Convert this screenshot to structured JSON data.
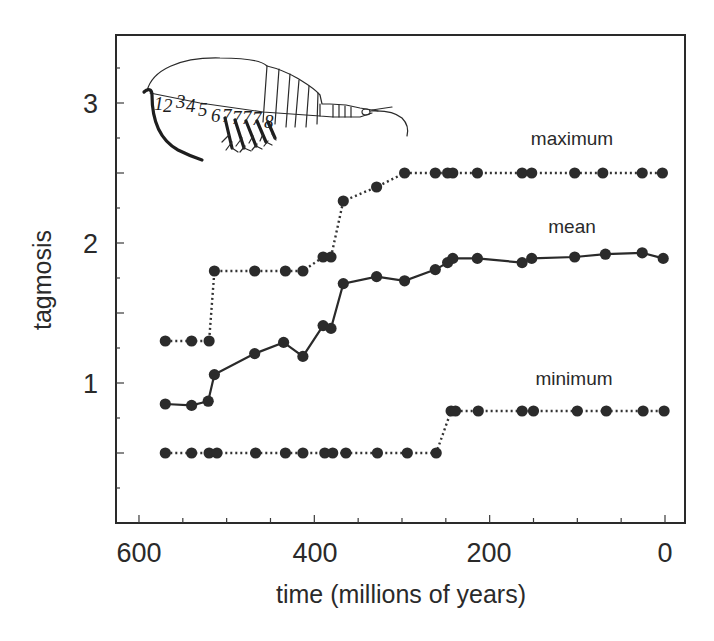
{
  "chart_data": {
    "type": "line",
    "title": "",
    "xlabel": "time (millions of years)",
    "ylabel": "tagmosis",
    "xlim": [
      626,
      -22
    ],
    "x_reversed": true,
    "ylim": [
      0,
      3.47
    ],
    "x_ticks": [
      600,
      400,
      200,
      0
    ],
    "x_minor_ticks": [
      600,
      550,
      500,
      450,
      400,
      350,
      300,
      250,
      200,
      150,
      100,
      50,
      0
    ],
    "y_ticks": [
      1,
      2,
      3
    ],
    "y_minor_ticks": [
      0.25,
      0.5,
      0.75,
      1,
      1.25,
      1.5,
      1.75,
      2,
      2.25,
      2.5,
      2.75,
      3,
      3.25
    ],
    "grid": false,
    "legend": "inline labels",
    "series": [
      {
        "name": "maximum",
        "style": "dotted",
        "label_pos": [
          115,
          2.7
        ],
        "x": [
          570,
          540,
          520,
          514,
          468,
          433,
          413,
          390,
          381,
          367,
          329,
          297,
          262,
          248,
          242,
          214,
          163,
          152,
          103,
          71,
          26,
          3
        ],
        "values": [
          1.3,
          1.3,
          1.3,
          1.8,
          1.8,
          1.8,
          1.8,
          1.9,
          1.9,
          2.3,
          2.4,
          2.5,
          2.5,
          2.5,
          2.5,
          2.5,
          2.5,
          2.5,
          2.5,
          2.5,
          2.5,
          2.5
        ]
      },
      {
        "name": "mean",
        "style": "solid",
        "label_pos": [
          115,
          2.07
        ],
        "x": [
          570,
          540,
          521,
          514,
          468,
          435,
          413,
          390,
          381,
          367,
          329,
          297,
          262,
          248,
          242,
          214,
          163,
          152,
          103,
          68,
          26,
          2
        ],
        "values": [
          0.85,
          0.84,
          0.87,
          1.06,
          1.21,
          1.29,
          1.19,
          1.41,
          1.39,
          1.71,
          1.76,
          1.73,
          1.81,
          1.86,
          1.89,
          1.89,
          1.86,
          1.89,
          1.9,
          1.92,
          1.93,
          1.89
        ]
      },
      {
        "name": "minimum",
        "style": "dotted",
        "label_pos": [
          113,
          0.98
        ],
        "x": [
          570,
          540,
          520,
          511,
          467,
          433,
          413,
          388,
          379,
          364,
          328,
          294,
          261,
          244,
          239,
          213,
          163,
          150,
          100,
          67,
          25,
          1
        ],
        "values": [
          0.5,
          0.5,
          0.5,
          0.5,
          0.5,
          0.5,
          0.5,
          0.5,
          0.5,
          0.5,
          0.5,
          0.5,
          0.5,
          0.8,
          0.8,
          0.8,
          0.8,
          0.8,
          0.8,
          0.8,
          0.8,
          0.8
        ]
      }
    ],
    "annotations": [
      {
        "type": "illustration",
        "description": "crustacean (shrimp-like) drawing with numbered thoracic segments",
        "segment_numbers": "1 2 3 4 5 6 7 7 7 7 8"
      }
    ]
  },
  "labels": {
    "x_axis_title": "time (millions of years)",
    "y_axis_title": "tagmosis",
    "x_tick_labels": [
      "600",
      "400",
      "200",
      "0"
    ],
    "y_tick_labels": [
      "1",
      "2",
      "3"
    ],
    "series_labels": [
      "maximum",
      "mean",
      "minimum"
    ],
    "shrimp_segment_numbers": [
      "1",
      "2",
      "3",
      "4",
      "5",
      "6",
      "7",
      "7",
      "7",
      "7",
      "8"
    ]
  },
  "colors": {
    "ink": "#2a2a2a",
    "marker": "#2b2b2b",
    "background": "#ffffff"
  }
}
